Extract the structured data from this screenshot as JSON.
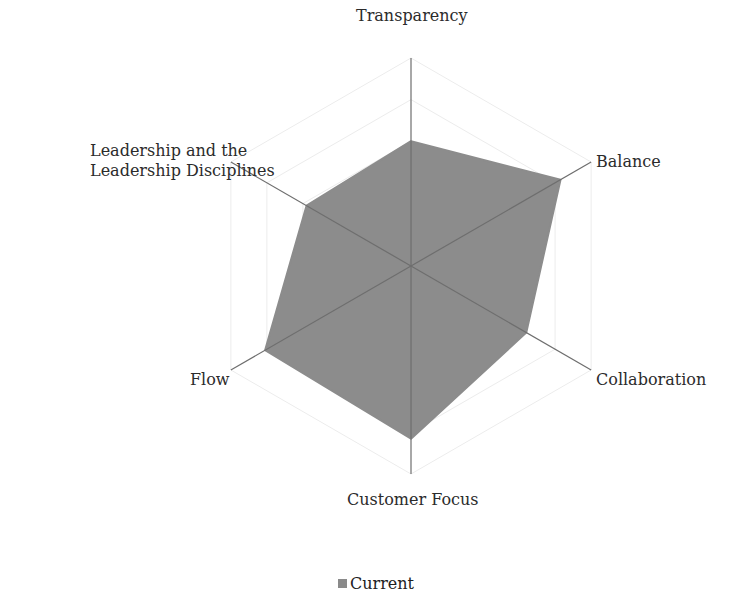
{
  "chart_data": {
    "type": "radar",
    "title": "",
    "categories": [
      "Transparency",
      "Balance",
      "Collaboration",
      "Customer Focus",
      "Flow",
      "Leadership and the Leadership Disciplines"
    ],
    "series": [
      {
        "name": "Current",
        "values": [
          3.0,
          4.15,
          3.2,
          4.15,
          4.05,
          2.9
        ],
        "color": "#8c8c8c"
      }
    ],
    "rlim": [
      0,
      5
    ],
    "grid_rings": 5,
    "grid": true,
    "legend_position": "bottom"
  },
  "labels": {
    "transparency": "Transparency",
    "balance": "Balance",
    "collaboration": "Collaboration",
    "customer_focus": "Customer Focus",
    "flow": "Flow",
    "leadership_line1": "Leadership and the",
    "leadership_line2": "Leadership Disciplines"
  },
  "legend": {
    "label": "Current"
  }
}
